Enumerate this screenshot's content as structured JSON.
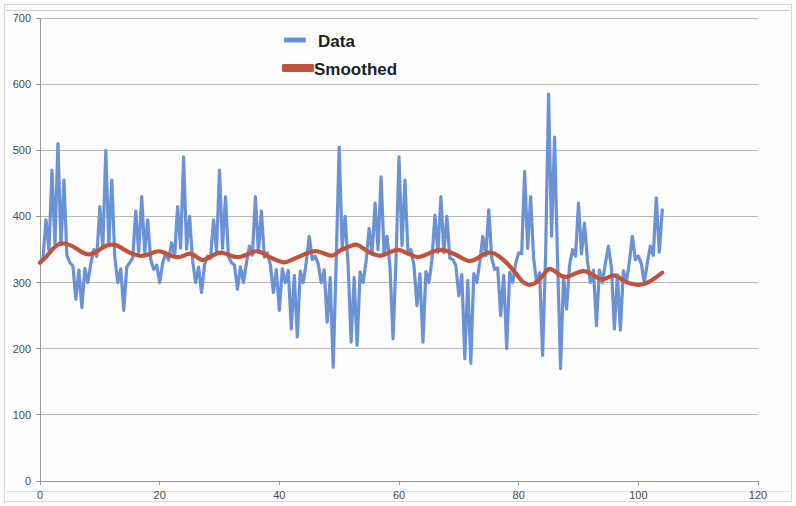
{
  "chart_data": {
    "type": "line",
    "title": "",
    "subtitle": "",
    "xlabel": "",
    "ylabel": "",
    "xlim": [
      0,
      120
    ],
    "ylim": [
      0,
      700
    ],
    "xticks": [
      0,
      20,
      40,
      60,
      80,
      100,
      120
    ],
    "yticks": [
      0,
      100,
      200,
      300,
      400,
      500,
      600,
      700
    ],
    "grid": "horizontal",
    "legend_position": "top-center",
    "colors": {
      "data": "#6a92d4",
      "smoothed": "#c0543a",
      "grid": "#b8b8b8",
      "axis": "#9a9a9a",
      "text": "#4a4a4a",
      "background": "#fdfdfd"
    },
    "series": [
      {
        "name": "Data",
        "color": "#6a92d4",
        "style": "noisy-line",
        "x": [
          0,
          1,
          2,
          3,
          4,
          5,
          6,
          7,
          8,
          9,
          10,
          11,
          12,
          13,
          14,
          15,
          16,
          17,
          18,
          19,
          20,
          21,
          22,
          23,
          24,
          25,
          26,
          27,
          28,
          29,
          30,
          31,
          32,
          33,
          34,
          35,
          36,
          37,
          38,
          39,
          40,
          41,
          42,
          43,
          44,
          45,
          46,
          47,
          48,
          49,
          50,
          51,
          52,
          53,
          54,
          55,
          56,
          57,
          58,
          59,
          60,
          61,
          62,
          63,
          64,
          65,
          66,
          67,
          68,
          69,
          70,
          71,
          72,
          73,
          74,
          75,
          76,
          77,
          78,
          79,
          80,
          81,
          82,
          83,
          84,
          85,
          86,
          87,
          88,
          89,
          90,
          91,
          92,
          93,
          94,
          95,
          96,
          97,
          98,
          99,
          100,
          101,
          102,
          103,
          104
        ],
        "values": [
          330,
          395,
          470,
          510,
          455,
          330,
          275,
          262,
          300,
          350,
          415,
          500,
          455,
          300,
          258,
          330,
          408,
          430,
          395,
          320,
          300,
          345,
          360,
          415,
          490,
          400,
          300,
          285,
          340,
          395,
          470,
          430,
          330,
          290,
          300,
          355,
          430,
          408,
          345,
          285,
          258,
          300,
          230,
          218,
          300,
          370,
          340,
          300,
          240,
          172,
          505,
          400,
          210,
          205,
          300,
          382,
          420,
          460,
          370,
          215,
          490,
          455,
          350,
          265,
          210,
          300,
          402,
          430,
          400,
          335,
          280,
          185,
          178,
          300,
          370,
          410,
          320,
          250,
          200,
          300,
          345,
          468,
          430,
          300,
          190,
          585,
          520,
          170,
          260,
          350,
          420,
          390,
          300,
          235,
          300,
          355,
          230,
          228,
          300,
          370,
          340,
          300,
          355,
          428,
          410
        ]
      },
      {
        "name": "Smoothed",
        "color": "#c0543a",
        "style": "thick-line",
        "x": [
          0,
          1,
          2,
          3,
          4,
          5,
          6,
          7,
          8,
          9,
          10,
          11,
          12,
          13,
          14,
          15,
          16,
          17,
          18,
          19,
          20,
          21,
          22,
          23,
          24,
          25,
          26,
          27,
          28,
          29,
          30,
          31,
          32,
          33,
          34,
          35,
          36,
          37,
          38,
          39,
          40,
          41,
          42,
          43,
          44,
          45,
          46,
          47,
          48,
          49,
          50,
          51,
          52,
          53,
          54,
          55,
          56,
          57,
          58,
          59,
          60,
          61,
          62,
          63,
          64,
          65,
          66,
          67,
          68,
          69,
          70,
          71,
          72,
          73,
          74,
          75,
          76,
          77,
          78,
          79,
          80,
          81,
          82,
          83,
          84,
          85,
          86,
          87,
          88,
          89,
          90,
          91,
          92,
          93,
          94,
          95,
          96,
          97,
          98,
          99,
          100,
          101,
          102,
          103,
          104
        ],
        "values": [
          330,
          338,
          350,
          358,
          360,
          357,
          352,
          346,
          342,
          344,
          350,
          356,
          358,
          356,
          350,
          345,
          342,
          340,
          342,
          346,
          348,
          344,
          340,
          338,
          340,
          345,
          340,
          333,
          336,
          342,
          346,
          344,
          340,
          338,
          340,
          344,
          348,
          346,
          340,
          336,
          332,
          330,
          334,
          338,
          342,
          346,
          348,
          346,
          342,
          340,
          348,
          352,
          356,
          358,
          352,
          346,
          342,
          340,
          344,
          348,
          350,
          346,
          342,
          338,
          340,
          344,
          348,
          350,
          348,
          344,
          340,
          334,
          332,
          336,
          342,
          346,
          344,
          338,
          330,
          320,
          308,
          298,
          296,
          300,
          310,
          322,
          318,
          310,
          308,
          312,
          316,
          318,
          314,
          308,
          304,
          308,
          312,
          306,
          300,
          298,
          296,
          298,
          302,
          308,
          315
        ]
      }
    ],
    "legend": [
      {
        "label": "Data",
        "color": "#6a92d4",
        "marker": "dash"
      },
      {
        "label": "Smoothed",
        "color": "#c0543a",
        "marker": "thick-bar"
      }
    ]
  },
  "plot_geometry": {
    "left": 40,
    "right": 758,
    "top": 18,
    "bottom": 481
  }
}
